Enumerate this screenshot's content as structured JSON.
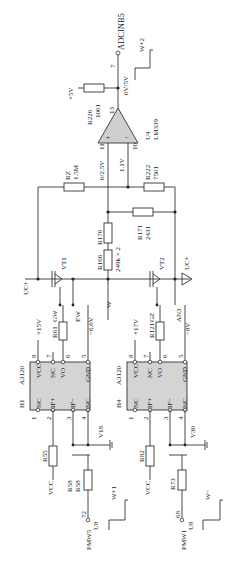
{
  "comparator": {
    "ref": "U4",
    "part": "LM339",
    "pin_out": "13",
    "pin_plus": "11",
    "pin_minus": "10",
    "plus": "+",
    "minus": "−"
  },
  "pullup": {
    "ref": "R226",
    "value": "1001",
    "supply": "+5V"
  },
  "output": {
    "pin": "7",
    "net": "ADCINB5",
    "level": "0V/5V",
    "waveform": "W+2"
  },
  "levels": {
    "plus_in": "0/2.5V",
    "minus_in": "1.1V"
  },
  "resistors": {
    "rz": {
      "ref": "RZ",
      "value": "1.5M"
    },
    "r222": {
      "ref": "R222",
      "value": "7501"
    },
    "r171": {
      "ref": "R171",
      "value": "2431"
    },
    "r176": {
      "ref": "R176"
    },
    "r166": {
      "ref": "R166",
      "value": "249k × 2"
    },
    "r61": {
      "ref": "R61"
    },
    "r121": {
      "ref": "R121"
    },
    "r55": {
      "ref": "R55"
    },
    "r82": {
      "ref": "R82"
    },
    "r58": {
      "ref": "R58",
      "value": "R58"
    },
    "r73": {
      "ref": "R73"
    }
  },
  "transistors": {
    "vt1": "VT1",
    "vt2": "VT2",
    "gw": "GW",
    "ew": "EW",
    "gz": "GZ",
    "an3": "AN3"
  },
  "nets": {
    "uc_left": "UC+",
    "uc_right": "UC+",
    "w": "W"
  },
  "drivers": [
    {
      "ref": "H1",
      "part": "A3120",
      "vcc": "+15V",
      "gnd": "−6.6V",
      "pins": {
        "p1": "1",
        "p2": "2",
        "p3": "3",
        "p4": "4",
        "p5": "5",
        "p6": "6",
        "p7": "7",
        "p8": "8"
      },
      "labels": {
        "nc1": "NC",
        "ifp": "IF+",
        "ifm": "IF−",
        "nc4": "NC",
        "vcc": "VCC",
        "nc7": "NC",
        "vo": "VO",
        "gnd": "GND"
      },
      "mosfet": "V18",
      "pwm": "PMW5",
      "pwm_pin": "72",
      "mcu": "U8",
      "input_vcc": "VCC",
      "waveform": "W+1"
    },
    {
      "ref": "H4",
      "part": "A3120",
      "vcc": "+17V",
      "gnd": "−8V",
      "pins": {
        "p1": "1",
        "p2": "2",
        "p3": "3",
        "p4": "4",
        "p5": "5",
        "p6": "6",
        "p7": "7",
        "p8": "8"
      },
      "labels": {
        "nc1": "NC",
        "ifp": "IF+",
        "ifm": "IF−",
        "nc4": "NC",
        "vcc": "VCC",
        "nc7": "NC",
        "vo": "VO",
        "gnd": "GND"
      },
      "mosfet": "V30",
      "pwm": "PMW1",
      "pwm_pin": "68",
      "mcu": "U8",
      "input_vcc": "VCC",
      "waveform": "W−"
    }
  ]
}
